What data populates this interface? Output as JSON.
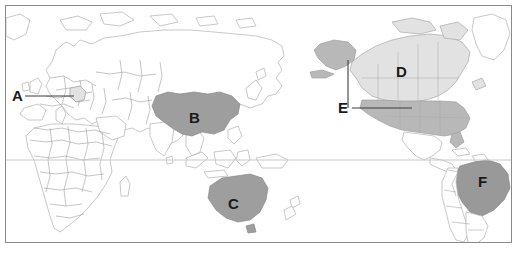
{
  "figure": {
    "type": "world-map",
    "projection": "pacific-centered equirectangular",
    "frame": {
      "x": 5,
      "y": 5,
      "width": 507,
      "height": 238,
      "border_color": "#8a8a8a"
    },
    "background_color": "#ffffff",
    "land_fill": "#ffffff",
    "land_border_color": "#b4b4b4",
    "country_border_color": "#9a9a9a",
    "equator_line_color": "#c8c8c8",
    "equator_y": 160
  },
  "shading": {
    "light_gray": "#e2e2e2",
    "medium_gray": "#b8b8b8",
    "dark_gray": "#9e9e9e",
    "darker_gray": "#999999"
  },
  "labels": [
    {
      "id": "A",
      "text": "A",
      "x": 12,
      "y": 88,
      "target": "european-country",
      "has_leader": true
    },
    {
      "id": "B",
      "text": "B",
      "x": 189,
      "y": 110,
      "target": "china",
      "has_leader": false
    },
    {
      "id": "C",
      "text": "C",
      "x": 228,
      "y": 196,
      "target": "australia",
      "has_leader": false
    },
    {
      "id": "D",
      "text": "D",
      "x": 396,
      "y": 64,
      "target": "canada",
      "has_leader": false
    },
    {
      "id": "E",
      "text": "E",
      "x": 338,
      "y": 100,
      "target": "united-states",
      "has_leader": true
    },
    {
      "id": "F",
      "text": "F",
      "x": 478,
      "y": 174,
      "target": "brazil",
      "has_leader": false
    }
  ],
  "leaders": [
    {
      "for": "A",
      "type": "horizontal",
      "x1": 25,
      "y1": 96,
      "x2": 74,
      "y2": 96,
      "color": "#3c3c3c"
    },
    {
      "for": "E",
      "type": "horizontal",
      "x1": 352,
      "y1": 108,
      "x2": 412,
      "y2": 108,
      "color": "#3c3c3c"
    },
    {
      "for": "E",
      "type": "vertical",
      "x1": 348,
      "y1": 60,
      "x2": 348,
      "y2": 108,
      "color": "#3c3c3c"
    }
  ],
  "shaded_regions": [
    {
      "name": "china",
      "label": "B",
      "tone": "dark_gray"
    },
    {
      "name": "australia",
      "label": "C",
      "tone": "dark_gray"
    },
    {
      "name": "canada",
      "label": "D",
      "tone": "light_gray"
    },
    {
      "name": "united-states",
      "label": "E",
      "tone": "medium_gray"
    },
    {
      "name": "alaska",
      "label": "E",
      "tone": "medium_gray"
    },
    {
      "name": "brazil",
      "label": "F",
      "tone": "darker_gray"
    },
    {
      "name": "european-country",
      "label": "A",
      "tone": "light_gray"
    }
  ]
}
